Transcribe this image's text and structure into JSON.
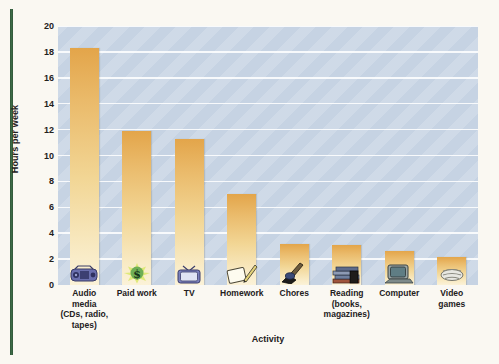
{
  "chart_data": {
    "type": "bar",
    "title": "",
    "xlabel": "Activity",
    "ylabel": "Hours per week",
    "ylim": [
      0,
      20
    ],
    "ytick_step": 2,
    "grid": true,
    "legend": "none",
    "categories": [
      "Audio media (CDs, radio, tapes)",
      "Paid work",
      "TV",
      "Homework",
      "Chores",
      "Reading (books, magazines)",
      "Computer",
      "Video games"
    ],
    "values": [
      18.3,
      11.9,
      11.25,
      7.0,
      3.2,
      3.1,
      2.6,
      2.2
    ],
    "yticks": [
      "0",
      "2",
      "4",
      "6",
      "8",
      "10",
      "12",
      "14",
      "16",
      "18",
      "20"
    ],
    "bars": [
      {
        "label_lines": [
          "Audio",
          "media",
          "(CDs, radio,",
          "tapes)"
        ],
        "value": 18.3,
        "icon": "boombox-icon"
      },
      {
        "label_lines": [
          "Paid work"
        ],
        "value": 11.9,
        "icon": "dollar-sign-icon"
      },
      {
        "label_lines": [
          "TV"
        ],
        "value": 11.25,
        "icon": "television-icon"
      },
      {
        "label_lines": [
          "Homework"
        ],
        "value": 7.0,
        "icon": "notebook-pencil-icon"
      },
      {
        "label_lines": [
          "Chores"
        ],
        "value": 3.2,
        "icon": "broom-icon"
      },
      {
        "label_lines": [
          "Reading",
          "(books,",
          "magazines)"
        ],
        "value": 3.1,
        "icon": "stack-of-books-icon"
      },
      {
        "label_lines": [
          "Computer"
        ],
        "value": 2.6,
        "icon": "desktop-computer-icon"
      },
      {
        "label_lines": [
          "Video games"
        ],
        "value": 2.2,
        "icon": "game-controller-icon"
      }
    ]
  },
  "colors": {
    "page_background": "#faf8f2",
    "plot_background": "#c6d3e3",
    "gridline": "#ffffff",
    "bar_top": "#e3a54a",
    "bar_bottom": "#fbf2d8",
    "text": "#23201c",
    "left_rule": "#2f5438"
  }
}
